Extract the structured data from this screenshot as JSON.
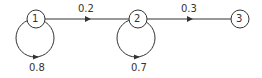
{
  "diagram": {
    "type": "state-transition-graph",
    "nodes": [
      {
        "id": "1",
        "label": "1"
      },
      {
        "id": "2",
        "label": "2"
      },
      {
        "id": "3",
        "label": "3"
      }
    ],
    "edges": [
      {
        "from": "1",
        "to": "2",
        "label": "0.2"
      },
      {
        "from": "2",
        "to": "3",
        "label": "0.3"
      },
      {
        "from": "1",
        "to": "1",
        "label": "0.8"
      },
      {
        "from": "2",
        "to": "2",
        "label": "0.7"
      }
    ],
    "colors": {
      "stroke": "#333333",
      "background": "#ffffff"
    }
  }
}
